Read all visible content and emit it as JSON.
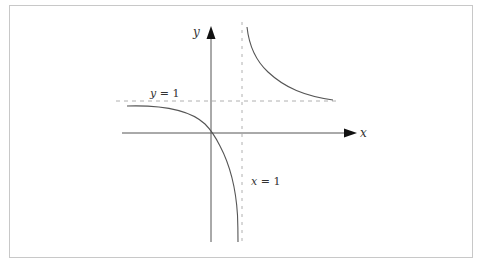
{
  "diagram": {
    "type": "function-graph",
    "axes": {
      "x_label": "x",
      "y_label": "y"
    },
    "asymptotes": {
      "horizontal": {
        "label": "y = 1",
        "label_var": "y",
        "label_rest": " = 1"
      },
      "vertical": {
        "label": "x = 1",
        "label_var": "x",
        "label_rest": " = 1"
      }
    },
    "colors": {
      "axis": "#555555",
      "curve": "#555555",
      "asymptote": "#b0b0b0",
      "frame": "#c8c8c8",
      "text": "#333333"
    },
    "branches": [
      {
        "name": "left-lower-branch",
        "description": "Approaches y = 1 from below as x → -∞, passes through origin, descends toward x = 1"
      },
      {
        "name": "right-upper-branch",
        "description": "Descends from near x = 1 toward y = 1 as x → +∞"
      }
    ]
  }
}
